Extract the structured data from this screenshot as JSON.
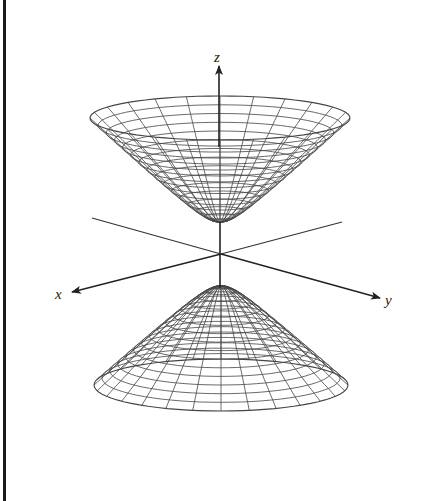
{
  "diagram": {
    "axes": {
      "x": {
        "label": "x"
      },
      "y": {
        "label": "y"
      },
      "z": {
        "label": "z"
      }
    },
    "sheets": [
      {
        "name": "upper-sheet",
        "opens": "up"
      },
      {
        "name": "lower-sheet",
        "opens": "down"
      }
    ],
    "colors": {
      "mesh": "#444444",
      "axis": "#222222",
      "border": "#1a1a1a",
      "background": "#ffffff"
    }
  }
}
